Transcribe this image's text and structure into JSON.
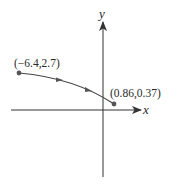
{
  "diagram": {
    "type": "coordinate-plane-path",
    "axes": {
      "x_label": "x",
      "y_label": "y"
    },
    "points": [
      {
        "label": "(−6.4,2.7)",
        "x": -6.4,
        "y": 2.7,
        "role": "start"
      },
      {
        "label": "(0.86,0.37)",
        "x": 0.86,
        "y": 0.37,
        "role": "end"
      }
    ],
    "path": {
      "description": "Curved path with direction arrows from start point to end point",
      "arrow_count": 2
    },
    "colors": {
      "axis": "#333333",
      "curve": "#444444",
      "point": "#555555",
      "text": "#2a2a2a"
    }
  }
}
